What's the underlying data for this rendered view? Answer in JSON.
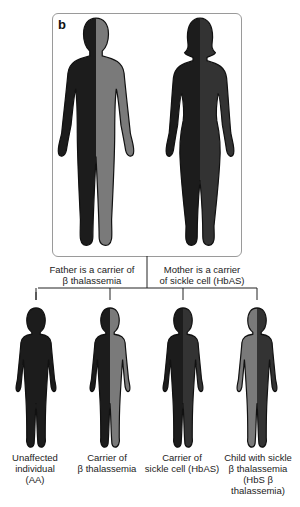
{
  "panel_label": "b",
  "colors": {
    "normal": "#1c1c1c",
    "beta_thal": "#7a7a7a",
    "sickle": "#333333"
  },
  "parents": [
    {
      "id": "father",
      "label": "Father is a carrier of β thalassemia",
      "label_lines": [
        "Father is a carrier of",
        "β thalassemia"
      ],
      "left_allele": "normal",
      "right_allele": "beta_thal"
    },
    {
      "id": "mother",
      "label": "Mother is a carrier of sickle cell (HbAS)",
      "label_lines": [
        "Mother is a carrier",
        "of sickle cell (HbAS)"
      ],
      "left_allele": "normal",
      "right_allele": "sickle"
    }
  ],
  "children": [
    {
      "id": "unaffected",
      "label_lines": [
        "Unaffected",
        "individual",
        "(AA)"
      ],
      "left_allele": "normal",
      "right_allele": "normal"
    },
    {
      "id": "carrier-beta",
      "label_lines": [
        "Carrier of",
        "β thalassemia"
      ],
      "left_allele": "normal",
      "right_allele": "beta_thal"
    },
    {
      "id": "carrier-sickle",
      "label_lines": [
        "Carrier of",
        "sickle cell (HbAS)"
      ],
      "left_allele": "normal",
      "right_allele": "sickle"
    },
    {
      "id": "sickle-beta",
      "label_lines": [
        "Child with sickle",
        "β thalassemia",
        "(HbS β",
        "thalassemia)"
      ],
      "left_allele": "beta_thal",
      "right_allele": "sickle"
    }
  ]
}
